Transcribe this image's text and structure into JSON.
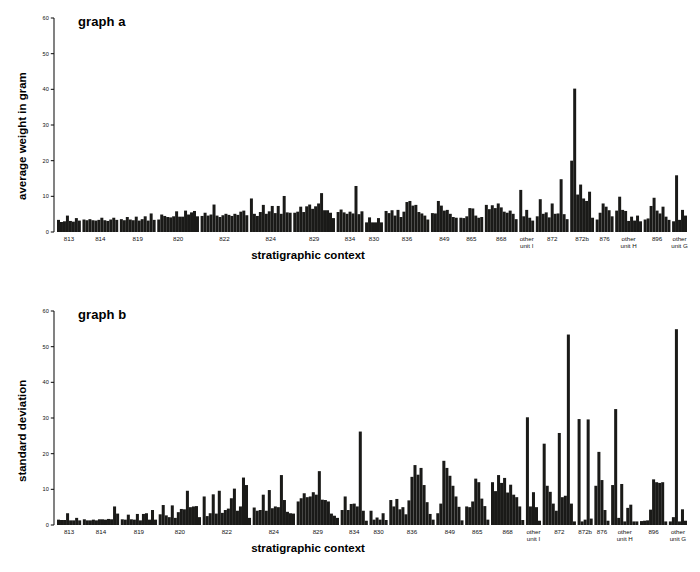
{
  "figure": {
    "width": 700,
    "height": 572,
    "background": "#ffffff",
    "ink_color": "#1a1a18"
  },
  "panels": [
    {
      "id": "a",
      "title": "graph a",
      "ylabel": "average weight in gram",
      "xlabel": "stratigraphic context"
    },
    {
      "id": "b",
      "title": "graph b",
      "ylabel": "standard deviation",
      "xlabel": "stratigraphic context"
    }
  ],
  "chart_data": [
    {
      "type": "bar",
      "title": "graph a",
      "xlabel": "stratigraphic context",
      "ylabel": "average weight in gram",
      "ylim": [
        0,
        60
      ],
      "yticks": [
        0,
        10,
        20,
        30,
        40,
        50,
        60
      ],
      "grid": false,
      "legend": "none",
      "categories": [
        "813",
        "814",
        "819",
        "820",
        "822",
        "824",
        "829",
        "834",
        "830",
        "836",
        "849",
        "865",
        "868",
        "other unit I",
        "872",
        "872b",
        "876",
        "other unit H",
        "896",
        "other unit G"
      ],
      "groups": [
        {
          "label": "813",
          "values": [
            3.4,
            2.8,
            3.0,
            4.6,
            3.1,
            2.9,
            3.9,
            3.2
          ]
        },
        {
          "label": "814",
          "values": [
            3.5,
            3.3,
            3.6,
            3.3,
            3.2,
            3.4,
            4.0,
            3.3,
            3.1,
            3.5,
            4.0,
            3.4
          ]
        },
        {
          "label": "819",
          "values": [
            3.6,
            3.3,
            4.2,
            3.5,
            3.3,
            4.3,
            3.2,
            3.6,
            4.4,
            3.2,
            5.2,
            3.4
          ]
        },
        {
          "label": "820",
          "values": [
            3.5,
            4.9,
            4.5,
            4.2,
            4.1,
            4.4,
            5.8,
            4.3,
            4.3,
            6.0,
            4.9,
            5.5,
            5.9,
            4.4
          ]
        },
        {
          "label": "822",
          "values": [
            4.5,
            5.4,
            4.6,
            4.9,
            7.7,
            4.6,
            4.2,
            4.7,
            5.1,
            4.8,
            4.5,
            5.1,
            4.8,
            5.7,
            6.0,
            4.7
          ]
        },
        {
          "label": "824",
          "values": [
            9.4,
            5.1,
            4.5,
            5.6,
            7.6,
            5.1,
            5.8,
            7.3,
            5.3,
            7.3,
            5.1,
            10.1,
            5.5,
            5.4
          ]
        },
        {
          "label": "829",
          "values": [
            5.4,
            5.7,
            7.1,
            5.6,
            7.2,
            7.7,
            6.5,
            7.2,
            8.0,
            10.9,
            6.1,
            6.1,
            5.4,
            3.9
          ]
        },
        {
          "label": "834",
          "values": [
            5.6,
            6.3,
            5.5,
            5.1,
            5.7,
            5.2,
            12.9,
            5.0,
            5.8
          ]
        },
        {
          "label": "830",
          "values": [
            2.7,
            4.1,
            2.7,
            2.7,
            3.9,
            2.7
          ]
        },
        {
          "label": "836",
          "values": [
            5.9,
            5.3,
            6.1,
            4.6,
            6.2,
            4.2,
            5.7,
            8.4,
            8.7,
            7.4,
            7.6,
            5.6,
            5.2,
            4.6,
            3.5
          ]
        },
        {
          "label": "849",
          "values": [
            5.3,
            5.2,
            8.7,
            7.4,
            6.0,
            6.2,
            5.1,
            4.2,
            4.0
          ]
        },
        {
          "label": "865",
          "values": [
            4.0,
            3.9,
            4.4,
            6.7,
            6.6,
            4.6,
            4.0,
            4.2
          ]
        },
        {
          "label": "868",
          "values": [
            7.6,
            6.4,
            7.5,
            6.7,
            8.0,
            6.9,
            5.7,
            5.4,
            6.0,
            5.1,
            3.6
          ]
        },
        {
          "label": "other unit I",
          "values": [
            11.8,
            4.4,
            6.2,
            4.0,
            3.2
          ]
        },
        {
          "label": "872",
          "values": [
            4.4,
            9.2,
            5.1,
            5.5,
            4.1,
            8.0,
            5.1,
            5.2,
            14.8,
            5.0,
            3.6
          ]
        },
        {
          "label": "872b",
          "values": [
            20.0,
            40.2,
            10.5,
            13.3,
            9.4,
            8.7,
            11.3,
            4.0
          ]
        },
        {
          "label": "876",
          "values": [
            3.5,
            5.4,
            8.0,
            7.1,
            6.1,
            4.4
          ]
        },
        {
          "label": "other unit H",
          "values": [
            6.0,
            9.9,
            6.2,
            5.9,
            3.1,
            4.3,
            3.2,
            4.6,
            3.0
          ]
        },
        {
          "label": "896",
          "values": [
            3.5,
            3.8,
            7.3,
            9.6,
            6.0,
            5.2,
            7.1,
            4.3,
            3.4
          ]
        },
        {
          "label": "other unit G",
          "values": [
            3.0,
            15.9,
            3.4,
            6.2,
            4.6
          ]
        }
      ]
    },
    {
      "type": "bar",
      "title": "graph b",
      "xlabel": "stratigraphic context",
      "ylabel": "standard deviation",
      "ylim": [
        0,
        60
      ],
      "yticks": [
        0,
        10,
        20,
        30,
        40,
        50,
        60
      ],
      "grid": false,
      "legend": "none",
      "categories": [
        "813",
        "814",
        "819",
        "820",
        "822",
        "824",
        "829",
        "834",
        "830",
        "836",
        "849",
        "865",
        "868",
        "other unit I",
        "872",
        "872b",
        "876",
        "other unit H",
        "896",
        "other unit G"
      ],
      "groups": [
        {
          "label": "813",
          "values": [
            1.5,
            1.4,
            1.4,
            3.3,
            1.3,
            1.3,
            2.0,
            1.3
          ]
        },
        {
          "label": "814",
          "values": [
            1.6,
            1.3,
            1.3,
            1.5,
            1.3,
            1.6,
            1.6,
            1.5,
            1.7,
            1.6,
            5.2,
            3.2
          ]
        },
        {
          "label": "819",
          "values": [
            1.6,
            1.5,
            2.9,
            1.6,
            1.5,
            3.1,
            1.3,
            3.1,
            3.3,
            1.5,
            4.2,
            1.5
          ]
        },
        {
          "label": "820",
          "values": [
            3.0,
            5.6,
            2.7,
            2.2,
            5.5,
            2.0,
            3.6,
            4.5,
            4.4,
            9.6,
            5.0,
            5.2,
            5.3,
            2.2
          ]
        },
        {
          "label": "822",
          "values": [
            8.0,
            2.5,
            3.3,
            8.6,
            3.2,
            9.6,
            3.4,
            4.2,
            4.6,
            7.5,
            10.2,
            4.0,
            5.2,
            13.3,
            11.2,
            2.0
          ]
        },
        {
          "label": "824",
          "values": [
            4.9,
            4.0,
            4.2,
            8.5,
            4.0,
            9.8,
            4.7,
            5.2,
            5.0,
            14.0,
            7.0,
            3.7,
            3.3,
            3.2
          ]
        },
        {
          "label": "829",
          "values": [
            6.6,
            7.5,
            8.9,
            7.8,
            8.0,
            9.2,
            8.5,
            15.1,
            7.1,
            7.0,
            6.6,
            3.2,
            2.6,
            2.0
          ]
        },
        {
          "label": "834",
          "values": [
            4.2,
            8.0,
            4.2,
            5.9,
            6.0,
            5.2,
            26.2,
            4.0,
            1.2
          ]
        },
        {
          "label": "830",
          "values": [
            4.0,
            1.5,
            2.1,
            1.5,
            3.3,
            1.4
          ]
        },
        {
          "label": "836",
          "values": [
            7.0,
            5.2,
            7.3,
            4.4,
            5.0,
            3.0,
            6.9,
            13.5,
            16.8,
            14.1,
            16.0,
            11.2,
            6.4,
            3.1,
            1.5
          ]
        },
        {
          "label": "849",
          "values": [
            3.3,
            6.0,
            18.0,
            16.0,
            13.8,
            11.0,
            8.0,
            5.1,
            1.3
          ]
        },
        {
          "label": "865",
          "values": [
            5.2,
            5.0,
            6.6,
            13.0,
            12.0,
            7.4,
            5.3,
            1.5
          ]
        },
        {
          "label": "868",
          "values": [
            12.0,
            9.5,
            14.0,
            11.8,
            13.2,
            9.1,
            11.3,
            8.5,
            7.8,
            5.2,
            1.4
          ]
        },
        {
          "label": "other unit I",
          "values": [
            30.2,
            5.2,
            9.2,
            5.0,
            1.2
          ]
        },
        {
          "label": "872",
          "values": [
            22.8,
            11.0,
            9.3,
            6.0,
            4.0,
            25.8,
            7.8,
            8.2,
            53.4,
            6.0,
            1.0
          ]
        },
        {
          "label": "872b",
          "values": [
            29.7,
            1.0,
            1.5,
            29.6,
            1.8
          ]
        },
        {
          "label": "876",
          "values": [
            11.0,
            20.5,
            12.6,
            4.2,
            1.2
          ]
        },
        {
          "label": "other unit H",
          "values": [
            11.2,
            32.5,
            2.0,
            11.5,
            1.0,
            4.8,
            5.7,
            1.0,
            1.0
          ]
        },
        {
          "label": "896",
          "values": [
            1.1,
            1.2,
            1.3,
            4.3,
            12.8,
            12.0,
            11.8,
            12.0,
            1.0
          ]
        },
        {
          "label": "other unit G",
          "values": [
            1.0,
            2.2,
            54.9,
            1.0,
            4.4,
            1.2
          ]
        }
      ]
    }
  ]
}
